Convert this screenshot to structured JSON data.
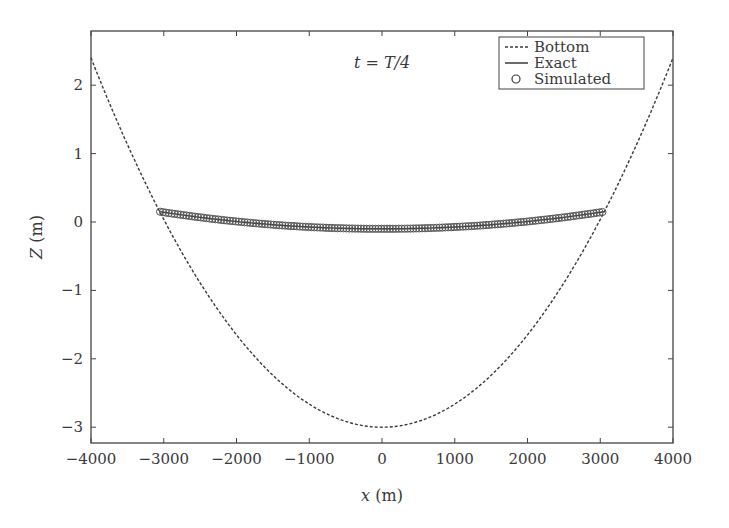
{
  "chart_data": {
    "type": "line",
    "title": "",
    "annotation": "t = T/4",
    "xlabel": "x (m)",
    "ylabel": "Z (m)",
    "xlim": [
      -4000,
      4000
    ],
    "ylim": [
      -3.2,
      2.8
    ],
    "xticks": [
      -4000,
      -3000,
      -2000,
      -1000,
      0,
      1000,
      2000,
      3000,
      4000
    ],
    "yticks": [
      -3,
      -2,
      -1,
      0,
      1,
      2
    ],
    "grid": false,
    "legend_position": "upper right",
    "series": [
      {
        "name": "Bottom",
        "style": "dashed",
        "x": [
          -4000,
          -3500,
          -3000,
          -2500,
          -2000,
          -1500,
          -1000,
          -500,
          0,
          500,
          1000,
          1500,
          2000,
          2500,
          3000,
          3500,
          4000
        ],
        "values": [
          2.4,
          1.13,
          0.04,
          -0.89,
          -1.65,
          -2.24,
          -2.66,
          -2.92,
          -3.0,
          -2.92,
          -2.66,
          -2.24,
          -1.65,
          -0.89,
          0.04,
          1.13,
          2.4
        ]
      },
      {
        "name": "Exact",
        "style": "solid",
        "x": [
          -3050,
          -2500,
          -2000,
          -1500,
          -1000,
          -500,
          0,
          500,
          1000,
          1500,
          2000,
          2500,
          3050
        ],
        "values": [
          0.15,
          0.06,
          -0.01,
          -0.06,
          -0.09,
          -0.1,
          -0.1,
          -0.1,
          -0.09,
          -0.06,
          -0.01,
          0.06,
          0.15
        ]
      },
      {
        "name": "Simulated",
        "style": "circle-markers",
        "x": [
          -3050,
          -2500,
          -2000,
          -1500,
          -1000,
          -500,
          0,
          500,
          1000,
          1500,
          2000,
          2500,
          3050
        ],
        "values": [
          0.15,
          0.06,
          -0.01,
          -0.06,
          -0.09,
          -0.1,
          -0.1,
          -0.1,
          -0.09,
          -0.06,
          -0.01,
          0.06,
          0.15
        ]
      }
    ]
  },
  "legend": {
    "items": [
      {
        "label": "Bottom",
        "symbol": "dashed-line"
      },
      {
        "label": "Exact",
        "symbol": "solid-line"
      },
      {
        "label": "Simulated",
        "symbol": "circle"
      }
    ]
  },
  "axes": {
    "x_tick_labels": [
      "−4000",
      "−3000",
      "−2000",
      "−1000",
      "0",
      "1000",
      "2000",
      "3000",
      "4000"
    ],
    "y_tick_labels": [
      "2",
      "1",
      "0",
      "−1",
      "−2",
      "−3"
    ]
  },
  "colors": {
    "line": "#3a3a3a",
    "marker": "#555555",
    "frame": "#444444"
  }
}
